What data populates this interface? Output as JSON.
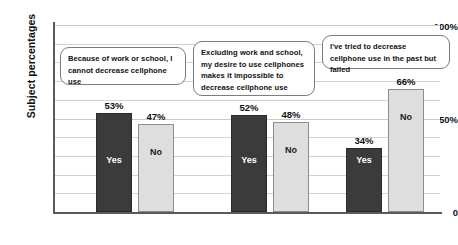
{
  "chart_data": {
    "type": "bar",
    "title": "",
    "subtitle": "",
    "xlabel": "",
    "ylabel": "Subject percentages",
    "ylim": [
      0,
      100
    ],
    "grid": true,
    "grid_interval": 10,
    "legend": "none",
    "categories": [
      "Because of work or school, I cannot decrease cellphone use",
      "Excluding work and school, my desire to use cellphones makes it impossible to decrease cellphone use",
      "I've tried to decrease cellphone use in the past but failed"
    ],
    "series": [
      {
        "name": "Yes",
        "values": [
          53,
          52,
          34
        ],
        "color": "#3b3b3b"
      },
      {
        "name": "No",
        "values": [
          47,
          48,
          66
        ],
        "color": "#dedede"
      }
    ],
    "ytick_labels": [
      "100%",
      "50%",
      "0"
    ],
    "ytick_values": [
      100,
      50,
      0
    ],
    "data_labels": [
      "53%",
      "47%",
      "52%",
      "48%",
      "34%",
      "66%"
    ],
    "annotations": [
      "Because of work or school, I cannot decrease cellphone use",
      "Excluding work and school, my desire to use cellphones makes it impossible to decrease cellphone use",
      "I've tried to decrease cellphone use in the past but failed"
    ]
  },
  "axis": {
    "y_title": "Subject percentages",
    "ticks": {
      "t100": "100%",
      "t50": "50%",
      "t0": "0"
    }
  },
  "bars": [
    {
      "group": 1,
      "answer": "Yes",
      "label": "53%",
      "inner": "Yes"
    },
    {
      "group": 1,
      "answer": "No",
      "label": "47%",
      "inner": "No"
    },
    {
      "group": 2,
      "answer": "Yes",
      "label": "52%",
      "inner": "Yes"
    },
    {
      "group": 2,
      "answer": "No",
      "label": "48%",
      "inner": "No"
    },
    {
      "group": 3,
      "answer": "Yes",
      "label": "34%",
      "inner": "Yes"
    },
    {
      "group": 3,
      "answer": "No",
      "label": "66%",
      "inner": "No"
    }
  ],
  "callouts": [
    {
      "text": "Because of work or school, I cannot decrease cellphone use"
    },
    {
      "text": "Excluding work and school, my desire to use cellphones makes it impossible to decrease cellphone use"
    },
    {
      "text": "I've tried to decrease cellphone use in the past but failed"
    }
  ]
}
